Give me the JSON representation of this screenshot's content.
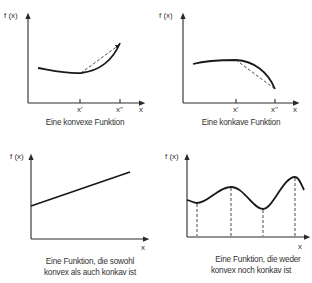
{
  "panels": [
    {
      "id": "convex",
      "y_label": "f (x)",
      "x_label": "x",
      "tick_labels": [
        "x'",
        "x''"
      ],
      "caption": [
        "Eine konvexe Funktion"
      ],
      "curve_type": "convex",
      "has_chord": true
    },
    {
      "id": "concave",
      "y_label": "f (x)",
      "x_label": "x",
      "tick_labels": [
        "x'",
        "x''"
      ],
      "caption": [
        "Eine konkave Funktion"
      ],
      "curve_type": "concave",
      "has_chord": true
    },
    {
      "id": "linear",
      "y_label": "f (x)",
      "x_label": "x",
      "tick_labels": [],
      "caption": [
        "Eine Funktion, die sowohl",
        "konvex als auch konkav ist"
      ],
      "curve_type": "linear",
      "has_chord": false
    },
    {
      "id": "wave",
      "y_label": "f (x)",
      "x_label": "x",
      "tick_labels": [],
      "caption": [
        "Eine Funktion, die weder",
        "konvex noch konkav ist"
      ],
      "curve_type": "wavy",
      "has_chord": false,
      "extrema_markers": 4
    }
  ],
  "colors": {
    "line": "#1a1a1a",
    "text": "#333333",
    "background": "#ffffff"
  }
}
